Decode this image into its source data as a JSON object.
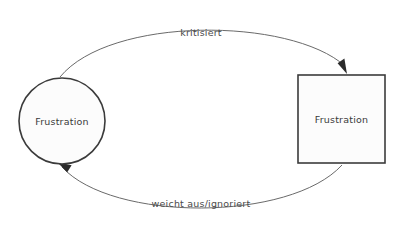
{
  "diagram": {
    "background_color": "#ffffff",
    "node_fill_color": "#fcfcfc",
    "node_stroke_color": "#3b3b3b",
    "edge_color": "#6a6a6a",
    "arrow_color": "#2b2b2b",
    "text_color": "#3a3a3a",
    "nodes": [
      {
        "id": "circle-node",
        "shape": "circle",
        "label": "Frustration",
        "cx": 62,
        "cy": 121,
        "r": 43
      },
      {
        "id": "square-node",
        "shape": "rectangle",
        "label": "Frustration",
        "x": 298,
        "y": 75,
        "width": 87,
        "height": 88
      }
    ],
    "edges": [
      {
        "id": "edge-kritisiert",
        "label": "kritisiert",
        "from": "circle-node",
        "to": "square-node",
        "label_x": 201,
        "label_y": 36,
        "direction": "left-to-right",
        "curve": "arc-above"
      },
      {
        "id": "edge-weicht-aus",
        "label": "weicht aus/ignoriert",
        "from": "square-node",
        "to": "circle-node",
        "label_x": 201,
        "label_y": 207,
        "direction": "right-to-left",
        "curve": "arc-below"
      }
    ]
  }
}
